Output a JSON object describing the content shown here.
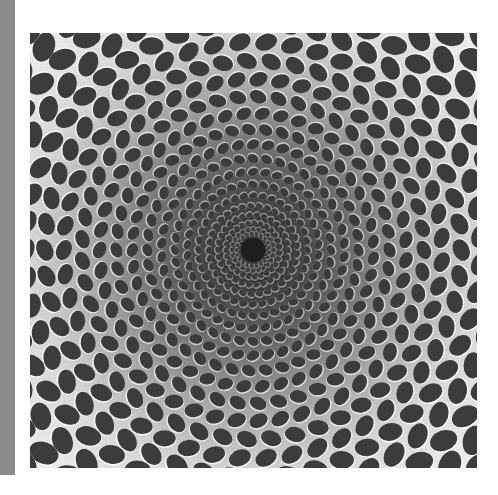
{
  "image": {
    "description": "Op-art optical illusion: concentric rings of dark elliptical dots receding into a tunnel",
    "colors": {
      "side_bar": "#8a8a8a",
      "background": "#ffffff",
      "dot": "#3c3c3c",
      "highlight": "#ffffff",
      "center": "#1e1e1e",
      "edge": "#f0f0f0"
    },
    "rings": 22,
    "center": [
      223,
      217
    ]
  }
}
